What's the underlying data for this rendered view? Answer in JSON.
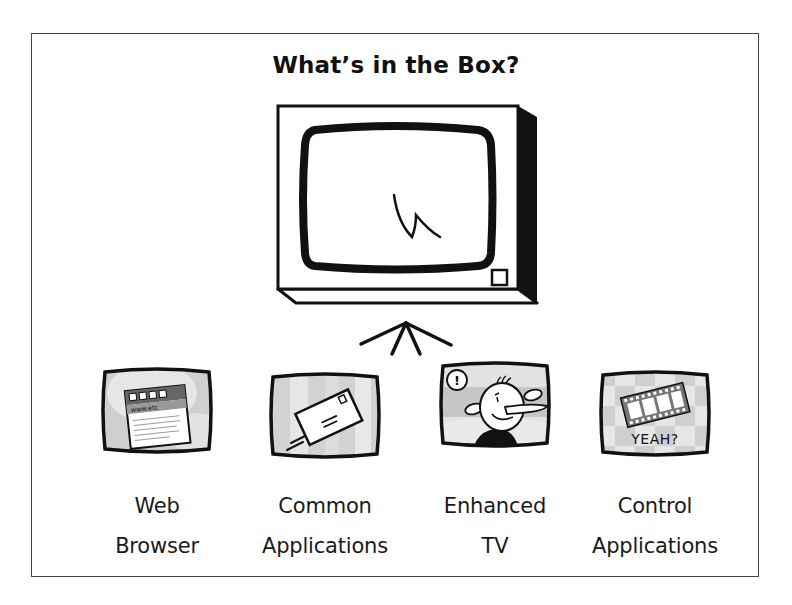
{
  "title": "What’s in the Box?",
  "main_tv": {
    "icon": "television-icon",
    "screen_glyph": "lightning-scribble"
  },
  "arrow": {
    "icon": "converging-arrow-icon"
  },
  "items": [
    {
      "id": "web-browser",
      "icon": "web-browser-icon",
      "label_line1": "Web",
      "label_line2": "Browser",
      "detail": "www.etc"
    },
    {
      "id": "common-applications",
      "icon": "envelope-icon",
      "label_line1": "Common",
      "label_line2": "Applications"
    },
    {
      "id": "enhanced-tv",
      "icon": "cartoon-face-icon",
      "label_line1": "Enhanced",
      "label_line2": "TV",
      "bubble": "!"
    },
    {
      "id": "control-applications",
      "icon": "film-strip-icon",
      "label_line1": "Control",
      "label_line2": "Applications",
      "caption": "YEAH?"
    }
  ],
  "colors": {
    "ink": "#111111",
    "frame": "#444444",
    "screen_gray": "#c8c8c8",
    "screen_light": "#e4e4e4",
    "background": "#ffffff"
  }
}
